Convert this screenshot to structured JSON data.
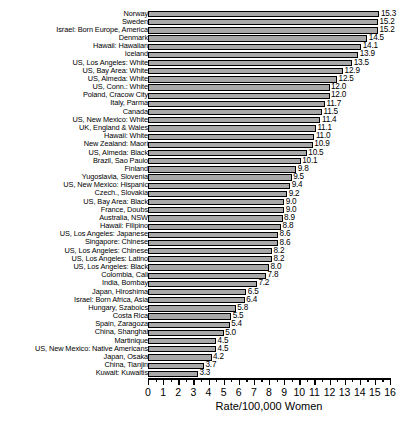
{
  "chart_data": {
    "type": "bar",
    "orientation": "horizontal",
    "title": "",
    "subtitle": "",
    "xlabel": "Rate/100,000 Women",
    "ylabel": "",
    "xlim": [
      0,
      16
    ],
    "xticks": [
      0,
      1,
      2,
      3,
      4,
      5,
      6,
      7,
      8,
      9,
      10,
      11,
      12,
      13,
      14,
      15,
      16
    ],
    "xtick_labels": [
      "0",
      "1",
      "2",
      "3",
      "4",
      "5",
      "6",
      "7",
      "8",
      "9",
      "10",
      "11",
      "12",
      "13",
      "14",
      "15",
      "16"
    ],
    "minor_ticks": true,
    "grid": false,
    "legend": null,
    "bar_color": "#a8a8a8",
    "bar_edge_color": "#000000",
    "data_labels": true,
    "categories": [
      "Norway",
      "Sweden",
      "Israel: Born Europe, America",
      "Denmark",
      "Hawaii: Hawaiian",
      "Iceland",
      "US, Los Angeles: White",
      "US, Bay Area: White",
      "US, Almeda: White",
      "US, Conn.: White",
      "Poland, Cracow City",
      "Italy, Parma",
      "Canada",
      "US, New Mexico: White",
      "UK, England & Wales",
      "Hawaii: White",
      "New Zealand: Maori",
      "US, Almeda: Black",
      "Brazil, Sao Paulo",
      "Finland",
      "Yugoslavia, Slovenia",
      "US, New Mexico: Hispanic",
      "Czech., Slovakia",
      "US, Bay Area: Black",
      "France, Doubs",
      "Australia, NSW",
      "Hawaii: Filipino",
      "US, Los Angeles: Japanese",
      "Singapore: Chinese",
      "US, Los Angeles: Chinese",
      "US, Los Angeles: Latino",
      "US, Los Angeles: Black",
      "Colombia, Cali",
      "India, Bombay",
      "Japan, Hiroshima",
      "Israel: Born Africa, Asia",
      "Hungary, Szabolcs",
      "Costa Rica",
      "Spain, Zaragoza",
      "China, Shanghai",
      "Martinique",
      "US, New Mexico: Native Americans",
      "Japan, Osaka",
      "China, Tianjin",
      "Kuwait: Kuwaitis"
    ],
    "values": [
      15.3,
      15.2,
      15.2,
      14.5,
      14.1,
      13.9,
      13.5,
      12.9,
      12.5,
      12.0,
      12.0,
      11.7,
      11.5,
      11.4,
      11.1,
      11.0,
      10.9,
      10.5,
      10.1,
      9.8,
      9.5,
      9.4,
      9.2,
      9.0,
      9.0,
      8.9,
      8.8,
      8.6,
      8.6,
      8.2,
      8.2,
      8.0,
      7.8,
      7.2,
      6.5,
      6.4,
      5.8,
      5.5,
      5.4,
      5.0,
      4.5,
      4.5,
      4.2,
      3.7,
      3.3
    ],
    "value_labels": [
      "15.3",
      "15.2",
      "15.2",
      "14.5",
      "14.1",
      "13.9",
      "13.5",
      "12.9",
      "12.5",
      "12.0",
      "12.0",
      "11.7",
      "11.5",
      "11.4",
      "11.1",
      "11.0",
      "10.9",
      "10.5",
      "10.1",
      "9.8",
      "9.5",
      "9.4",
      "9.2",
      "9.0",
      "9.0",
      "8.9",
      "8.8",
      "8.6",
      "8.6",
      "8.2",
      "8.2",
      "8.0",
      "7.8",
      "7.2",
      "6.5",
      "6.4",
      "5.8",
      "5.5",
      "5.4",
      "5.0",
      "4.5",
      "4.5",
      "4.2",
      "3.7",
      "3.3"
    ]
  }
}
